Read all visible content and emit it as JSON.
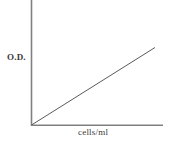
{
  "chart_data": {
    "type": "line",
    "title": "",
    "xlabel": "cells/ml",
    "ylabel": "O.D.",
    "grid": false,
    "legend": null,
    "annotations": [],
    "axis_color": "#808080",
    "line_color": "#5a5a5a",
    "background": "#ffffff",
    "xlim": [
      0,
      1
    ],
    "ylim": [
      0,
      1
    ],
    "xticks": [],
    "yticks": [],
    "series": [
      {
        "name": "O.D. vs cells/ml",
        "x": [
          0,
          1
        ],
        "values": [
          0,
          0.62
        ]
      }
    ]
  },
  "figure": {
    "y_axis_label": "O.D.",
    "x_axis_label": "cells/ml"
  }
}
